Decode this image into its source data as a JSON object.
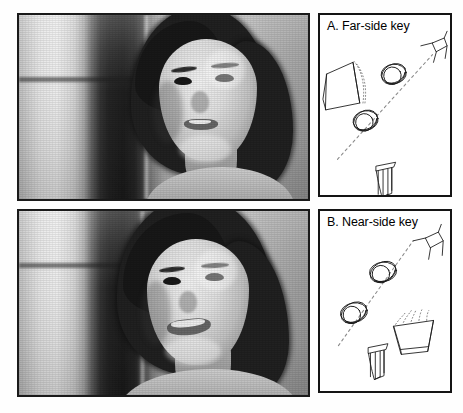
{
  "figure": {
    "layout": "two-column; left column = two stacked grayscale photographs, right column = two stacked line-drawing key panels",
    "background_color": "#ffffff",
    "border_color": "#141414"
  },
  "photos": [
    {
      "id": "photo-top",
      "position": "top-left",
      "description": "Grayscale photograph of a young woman with short dark bob hair, head turned slightly, looking to the viewer's right, in front of a bright curtained window with a dark vertical frame",
      "gaze": "eyes directed toward viewer-right / far side",
      "expression": "neutral, lips slightly parted"
    },
    {
      "id": "photo-bottom",
      "position": "bottom-left",
      "description": "Grayscale photograph of the same young woman smiling, head tilted, hair falling over the left of her face, same curtained window background",
      "gaze": "eyes directed toward viewer-right / near side",
      "expression": "smiling, teeth visible"
    }
  ],
  "panels": [
    {
      "id": "panel-a",
      "letter": "A.",
      "title": "A. Far-side key",
      "title_text": "Far-side key",
      "dashed_midline": true,
      "objects": [
        {
          "name": "cone",
          "label": "cone / funnel shape with dotted shading",
          "position": "left"
        },
        {
          "name": "ringed-ball-1",
          "label": "ringed sphere",
          "position": "upper-middle"
        },
        {
          "name": "ringed-ball-2",
          "label": "ringed sphere",
          "position": "lower-middle"
        },
        {
          "name": "wire-chair",
          "label": "wireframe chair / stick object",
          "position": "upper-right"
        },
        {
          "name": "column",
          "label": "column / pillar",
          "position": "bottom-middle"
        }
      ]
    },
    {
      "id": "panel-b",
      "letter": "B.",
      "title": "B. Near-side key",
      "title_text": "Near-side key",
      "dashed_midline": true,
      "objects": [
        {
          "name": "ringed-ball-1",
          "label": "ringed sphere",
          "position": "upper-middle"
        },
        {
          "name": "ringed-ball-2",
          "label": "ringed sphere",
          "position": "middle-left"
        },
        {
          "name": "wire-chair",
          "label": "wireframe chair / stick object",
          "position": "upper-right"
        },
        {
          "name": "cone",
          "label": "cone / funnel shape with dotted shading",
          "position": "lower-right"
        },
        {
          "name": "column",
          "label": "column / pillar",
          "position": "bottom-middle"
        }
      ]
    }
  ]
}
